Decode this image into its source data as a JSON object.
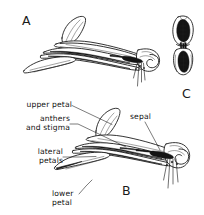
{
  "figure": {
    "background_color": "#ffffff",
    "ink_color": "#111111",
    "panels": [
      {
        "id": "A",
        "label": "A",
        "caption": "whole flower, side view"
      },
      {
        "id": "B",
        "label": "B",
        "caption": "flower with parts labelled, side view"
      },
      {
        "id": "C",
        "label": "C",
        "caption": "anthers and stigma detail, face view"
      }
    ],
    "panel_labels": {
      "a": "A",
      "b": "B",
      "c": "C"
    },
    "annotations": [
      {
        "name": "upper-petal",
        "lines": [
          "upper petal"
        ],
        "align": "right"
      },
      {
        "name": "anthers-and-stigma",
        "lines": [
          "anthers",
          "and stigma"
        ],
        "align": "right"
      },
      {
        "name": "lateral-petals",
        "lines": [
          "lateral",
          "petals"
        ],
        "align": "right"
      },
      {
        "name": "lower-petal",
        "lines": [
          "lower",
          "petal"
        ],
        "align": "right"
      },
      {
        "name": "sepal",
        "lines": [
          "sepal"
        ],
        "align": "left"
      }
    ],
    "annotation_text": {
      "upper_petal": "upper petal",
      "anthers_line1": "anthers",
      "anthers_line2": "and stigma",
      "lateral_line1": "lateral",
      "lateral_line2": "petals",
      "lower_line1": "lower",
      "lower_line2": "petal",
      "sepal": "sepal"
    }
  }
}
